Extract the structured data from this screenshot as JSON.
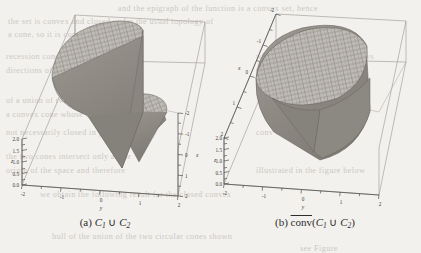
{
  "page": {
    "background_color": "#f3f1ee",
    "ink_color": "#3a3733",
    "ghost_text": [
      {
        "t": "and the epigraph of the function is a convex set, hence",
        "x": 118,
        "y": 4
      },
      {
        "t": "the set is convex and closed under the usual topology of",
        "x": 8,
        "y": 17
      },
      {
        "t": "a cone, so it is contained in",
        "x": 8,
        "y": 30
      },
      {
        "t": "recession cone and the set of all",
        "x": 6,
        "y": 52
      },
      {
        "t": "directions of the convex hull must",
        "x": 6,
        "y": 66
      },
      {
        "t": "which implies the result follows",
        "x": 256,
        "y": 52
      },
      {
        "t": "the closure of",
        "x": 256,
        "y": 66
      },
      {
        "t": "of a union of two convex cones is",
        "x": 6,
        "y": 96
      },
      {
        "t": "a convex cone whose closure is",
        "x": 6,
        "y": 110
      },
      {
        "t": "not necessarily closed in general",
        "x": 6,
        "y": 128
      },
      {
        "t": "conv of the union",
        "x": 256,
        "y": 128
      },
      {
        "t": "the two cones intersect only at the",
        "x": 6,
        "y": 152
      },
      {
        "t": "origin of the space and therefore",
        "x": 6,
        "y": 166
      },
      {
        "t": "illustrated in the figure below",
        "x": 256,
        "y": 166
      },
      {
        "t": "we obtain the following result for the closed convex",
        "x": 40,
        "y": 190
      },
      {
        "t": "hull of the union of the two circular cones shown",
        "x": 52,
        "y": 232
      },
      {
        "t": "see Figure",
        "x": 300,
        "y": 244
      }
    ]
  },
  "figure": {
    "type": "two-panel-3d-surface-figure",
    "panels": [
      {
        "id": "panel-a",
        "caption_label": "(a)",
        "caption_math": "C₁ ∪ C₂",
        "caption_parts": {
          "prefix": "(a)",
          "c": "C",
          "sub1": "1",
          "op": "∪",
          "sub2": "2"
        },
        "overline": false
      },
      {
        "id": "panel-b",
        "caption_label": "(b)",
        "caption_math": "conv(C₁ ∪ C₂)",
        "caption_parts": {
          "prefix": "(b)",
          "func": "conv",
          "c": "C",
          "sub1": "1",
          "op": "∪",
          "sub2": "2"
        },
        "overline": true
      }
    ]
  },
  "chart_data": [
    {
      "type": "surface",
      "id": "panel-a-plot",
      "title": "",
      "description": "Union of two circular cones C1 and C2 rendered as a 3D shaded mesh surface inside a wireframe bounding box",
      "xlabel": "x",
      "ylabel": "y",
      "zlabel": "z",
      "xlim": [
        -2,
        2
      ],
      "ylim": [
        -2,
        2
      ],
      "zlim": [
        0,
        2
      ],
      "xticks": [
        -2,
        -1,
        0,
        1,
        2
      ],
      "xticklabels": [
        "-2",
        "-1",
        "0",
        "1",
        "2"
      ],
      "yticks": [
        -2,
        -1,
        0,
        1,
        2
      ],
      "yticklabels": [
        "-2",
        "-1",
        "0",
        "1",
        "2"
      ],
      "zticks": [
        0.0,
        0.5,
        1.0,
        1.5,
        2.0
      ],
      "zticklabels": [
        "0.0",
        "0.5",
        "1.0",
        "1.5",
        "2.0"
      ],
      "grid": false,
      "legend": "none",
      "surface_fill": "#b5b1ab",
      "surface_shadow": "#8d8983",
      "mesh_color": "#6f6b65",
      "box_color": "#9b9792"
    },
    {
      "type": "surface",
      "id": "panel-b-plot",
      "title": "",
      "description": "Closed convex hull of the union of the two cones, a single merged convex cone body rendered as a 3D shaded mesh surface inside a wireframe bounding box",
      "xlabel": "x",
      "ylabel": "y",
      "zlabel": "z",
      "xlim": [
        -2,
        2
      ],
      "ylim": [
        -2,
        2
      ],
      "zlim": [
        0,
        2
      ],
      "xticks": [
        -2,
        -1,
        0,
        1,
        2
      ],
      "xticklabels": [
        "-2",
        "-1",
        "0",
        "1",
        "2"
      ],
      "yticks": [
        -2,
        -1,
        0,
        1,
        2
      ],
      "yticklabels": [
        "-2",
        "-1",
        "0",
        "1",
        "2"
      ],
      "zticks": [
        0.0,
        0.5,
        1.0,
        1.5,
        2.0
      ],
      "zticklabels": [
        "0.0",
        "0.5",
        "1.0",
        "1.5",
        "2.0"
      ],
      "grid": false,
      "legend": "none",
      "surface_fill": "#b5b1ab",
      "surface_shadow": "#8d8983",
      "mesh_color": "#6f6b65",
      "box_color": "#9b9792"
    }
  ]
}
